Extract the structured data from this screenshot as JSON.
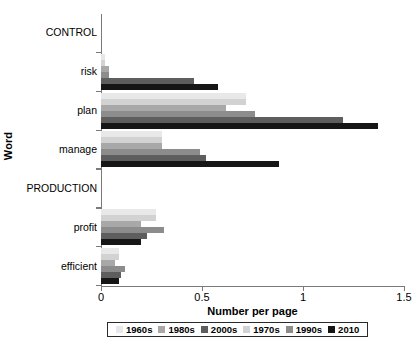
{
  "chart_data": {
    "type": "bar",
    "orientation": "horizontal",
    "title": "",
    "xlabel": "Number per page",
    "ylabel": "Word",
    "xlim": [
      0,
      1.5
    ],
    "xticks": [
      0,
      0.5,
      1,
      1.5
    ],
    "xticklabels": [
      "0",
      "0.5",
      "1",
      "1.5"
    ],
    "grid": false,
    "legend_position": "bottom",
    "categories": [
      "CONTROL",
      "risk",
      "plan",
      "manage",
      "PRODUCTION",
      "profit",
      "efficient"
    ],
    "category_is_header": [
      true,
      false,
      false,
      false,
      true,
      false,
      false
    ],
    "series": [
      {
        "name": "1960s",
        "color": "#e8e8e8",
        "values": [
          null,
          0.02,
          0.72,
          0.3,
          null,
          0.27,
          0.09
        ]
      },
      {
        "name": "1970s",
        "color": "#d2d2d2",
        "values": [
          null,
          0.02,
          0.72,
          0.3,
          null,
          0.27,
          0.09
        ]
      },
      {
        "name": "1980s",
        "color": "#a8a8a8",
        "values": [
          null,
          0.04,
          0.62,
          0.3,
          null,
          0.2,
          0.07
        ]
      },
      {
        "name": "1990s",
        "color": "#8c8c8c",
        "values": [
          null,
          0.04,
          0.76,
          0.49,
          null,
          0.31,
          0.12
        ]
      },
      {
        "name": "2000s",
        "color": "#5e5e5e",
        "values": [
          null,
          0.46,
          1.2,
          0.52,
          null,
          0.23,
          0.1
        ]
      },
      {
        "name": "2010",
        "color": "#161616",
        "values": [
          null,
          0.58,
          1.37,
          0.88,
          null,
          0.2,
          0.09
        ]
      }
    ],
    "series_draw_order": [
      "1960s",
      "1970s",
      "1980s",
      "1990s",
      "2000s",
      "2010"
    ],
    "legend_entries": [
      "1960s",
      "1980s",
      "2000s",
      "1970s",
      "1990s",
      "2010"
    ]
  },
  "legend": {
    "items": [
      {
        "label": "1960s",
        "color": "#e8e8e8"
      },
      {
        "label": "1980s",
        "color": "#a8a8a8"
      },
      {
        "label": "2000s",
        "color": "#5e5e5e"
      },
      {
        "label": "1970s",
        "color": "#d2d2d2"
      },
      {
        "label": "1990s",
        "color": "#8c8c8c"
      },
      {
        "label": "2010",
        "color": "#161616"
      }
    ]
  },
  "axes": {
    "x_title": "Number per page",
    "y_title": "Word",
    "x_tick_labels": [
      "0",
      "0.5",
      "1",
      "1.5"
    ]
  },
  "caption": {
    "text": ""
  }
}
